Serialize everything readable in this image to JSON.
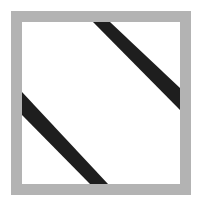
{
  "figure": {
    "width": 198,
    "height": 201,
    "background": "#ffffff"
  },
  "frame": {
    "outer": {
      "x": 11,
      "y": 11,
      "width": 180,
      "height": 184
    },
    "inner": {
      "x": 22,
      "y": 22,
      "width": 158,
      "height": 162
    },
    "frame_color": "#b3b3b3",
    "inner_fill": "#ffffff"
  },
  "stripes": [
    {
      "name": "upper-right-stripe",
      "color": "#1e1e1e",
      "points": "93,22 110,22 180,88 180,110"
    },
    {
      "name": "lower-left-stripe",
      "color": "#1e1e1e",
      "points": "22,92 22,115 90,184 108,184"
    }
  ]
}
